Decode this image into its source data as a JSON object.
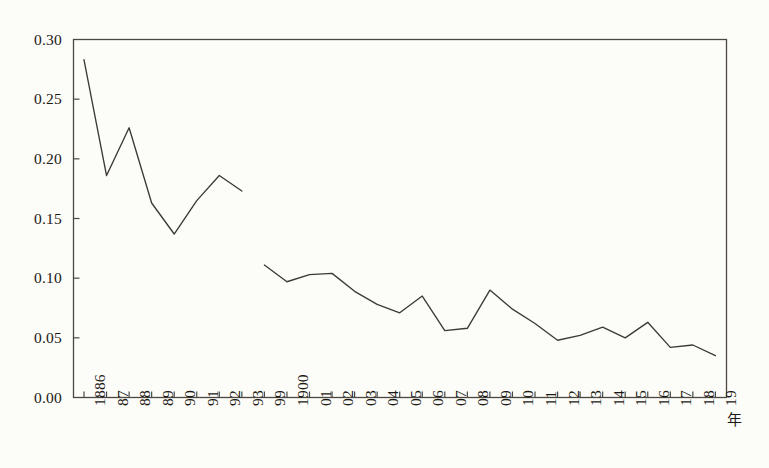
{
  "chart_data": {
    "type": "line",
    "title": "",
    "subtitle": "",
    "xlabel": "年",
    "ylabel": "",
    "grid": false,
    "legend": null,
    "ylim": [
      0.0,
      0.3
    ],
    "ytick_labels": [
      "0.30",
      "0.25",
      "0.20",
      "0.15",
      "0.10",
      "0.05",
      "0.00"
    ],
    "ytick_values": [
      0.3,
      0.25,
      0.2,
      0.15,
      0.1,
      0.05,
      0.0
    ],
    "categories": [
      "1886",
      "87",
      "88",
      "89",
      "90",
      "91",
      "92",
      "93",
      "99",
      "1900",
      "01",
      "02",
      "03",
      "04",
      "05",
      "06",
      "07",
      "08",
      "09",
      "10",
      "11",
      "12",
      "13",
      "14",
      "15",
      "16",
      "17",
      "18",
      "19"
    ],
    "series": [
      {
        "name": "segment-1",
        "x": [
          "1886",
          "87",
          "88",
          "89",
          "90",
          "91",
          "92",
          "93"
        ],
        "values": [
          0.283,
          0.186,
          0.226,
          0.163,
          0.137,
          0.165,
          0.186,
          0.173
        ]
      },
      {
        "name": "segment-2",
        "x": [
          "99",
          "1900",
          "01",
          "02",
          "03",
          "04",
          "05",
          "06",
          "07",
          "08",
          "09",
          "10",
          "11",
          "12",
          "13",
          "14",
          "15",
          "16",
          "17",
          "18",
          "19"
        ],
        "values": [
          0.111,
          0.097,
          0.103,
          0.104,
          0.089,
          0.078,
          0.071,
          0.085,
          0.056,
          0.058,
          0.09,
          0.074,
          0.062,
          0.048,
          0.052,
          0.059,
          0.05,
          0.063,
          0.042,
          0.044,
          0.035
        ]
      }
    ],
    "line_color": "#3c3a33",
    "axis_color": "#4a4840",
    "background_color": "#fcfcf8"
  }
}
